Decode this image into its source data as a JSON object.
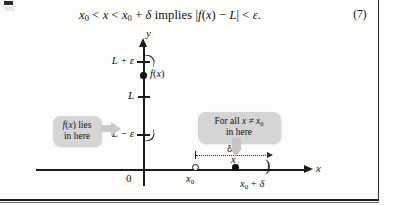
{
  "page": {
    "equation": {
      "text": "x₀ < x < x₀ + δ implies |f(x) − L| < ϵ.",
      "number": "(7)"
    }
  },
  "diagram": {
    "axes": {
      "y_label": "y",
      "x_label": "x",
      "origin_label": "0"
    },
    "y_ticks": [
      {
        "label": "L + ϵ"
      },
      {
        "label": "L"
      },
      {
        "label": "L − ϵ"
      }
    ],
    "points": {
      "fx_label": "f(x)",
      "x0_label": "x₀",
      "x_label": "x",
      "x0_plus_delta_label": "x₀ + δ",
      "right_paren": ")"
    },
    "delta_measure": {
      "label": "δ"
    },
    "callouts": [
      {
        "name": "fx-lies-in-here",
        "line1": "f(x) lies",
        "line2": "in here"
      },
      {
        "name": "for-all-x-in-here",
        "line1": "For all x ≠ x₀",
        "line2": "in here"
      }
    ]
  },
  "colors": {
    "ink": "#111111",
    "callout_bg": "#d5d5d5",
    "arrow_gray": "#c6c6c6",
    "paper": "#fdfdfc"
  }
}
